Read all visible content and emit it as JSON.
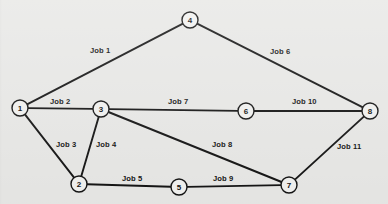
{
  "diagram": {
    "background_color": "#e8e8e6",
    "line_color": "#121212",
    "node_fill_color": "#f2f2f0",
    "nodes": [
      {
        "id": "1",
        "label": "1",
        "x": 20,
        "y": 108,
        "r": 8
      },
      {
        "id": "2",
        "label": "2",
        "x": 79,
        "y": 184,
        "r": 8
      },
      {
        "id": "3",
        "label": "3",
        "x": 101,
        "y": 109,
        "r": 8
      },
      {
        "id": "4",
        "label": "4",
        "x": 190,
        "y": 20,
        "r": 8
      },
      {
        "id": "5",
        "label": "5",
        "x": 179,
        "y": 187,
        "r": 8
      },
      {
        "id": "6",
        "label": "6",
        "x": 246,
        "y": 111,
        "r": 8
      },
      {
        "id": "7",
        "label": "7",
        "x": 289,
        "y": 185,
        "r": 8
      },
      {
        "id": "8",
        "label": "8",
        "x": 370,
        "y": 111,
        "r": 8
      }
    ],
    "edges": [
      {
        "id": "job-1",
        "label": "Job 1",
        "from": "1",
        "to": "4",
        "label_x": 90,
        "label_y": 47
      },
      {
        "id": "job-2",
        "label": "Job 2",
        "from": "1",
        "to": "3",
        "label_x": 50,
        "label_y": 98
      },
      {
        "id": "job-3",
        "label": "Job 3",
        "from": "1",
        "to": "2",
        "label_x": 56,
        "label_y": 141
      },
      {
        "id": "job-4",
        "label": "Job 4",
        "from": "3",
        "to": "2",
        "label_x": 96,
        "label_y": 141
      },
      {
        "id": "job-5",
        "label": "Job 5",
        "from": "2",
        "to": "5",
        "label_x": 122,
        "label_y": 175
      },
      {
        "id": "job-6",
        "label": "Job 6",
        "from": "4",
        "to": "8",
        "label_x": 270,
        "label_y": 48
      },
      {
        "id": "job-7",
        "label": "Job 7",
        "from": "3",
        "to": "6",
        "label_x": 168,
        "label_y": 98
      },
      {
        "id": "job-8",
        "label": "Job 8",
        "from": "3",
        "to": "7",
        "label_x": 212,
        "label_y": 141
      },
      {
        "id": "job-9",
        "label": "Job 9",
        "from": "5",
        "to": "7",
        "label_x": 213,
        "label_y": 175
      },
      {
        "id": "job-10",
        "label": "Job 10",
        "from": "6",
        "to": "8",
        "label_x": 292,
        "label_y": 98
      },
      {
        "id": "job-11",
        "label": "Job 11",
        "from": "7",
        "to": "8",
        "label_x": 337,
        "label_y": 143
      }
    ]
  }
}
